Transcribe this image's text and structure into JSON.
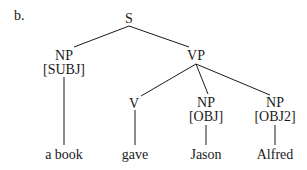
{
  "example_label": "b.",
  "colors": {
    "ink": "#1a1a1a",
    "background": "#ffffff"
  },
  "tree": {
    "root": {
      "label": "S"
    },
    "subject": {
      "category": "NP",
      "function": "[SUBJ]",
      "word": "a book"
    },
    "predicate": {
      "label": "VP"
    },
    "verb": {
      "category": "V",
      "word": "gave"
    },
    "object": {
      "category": "NP",
      "function": "[OBJ]",
      "word": "Jason"
    },
    "object2": {
      "category": "NP",
      "function": "[OBJ2]",
      "word": "Alfred"
    }
  }
}
